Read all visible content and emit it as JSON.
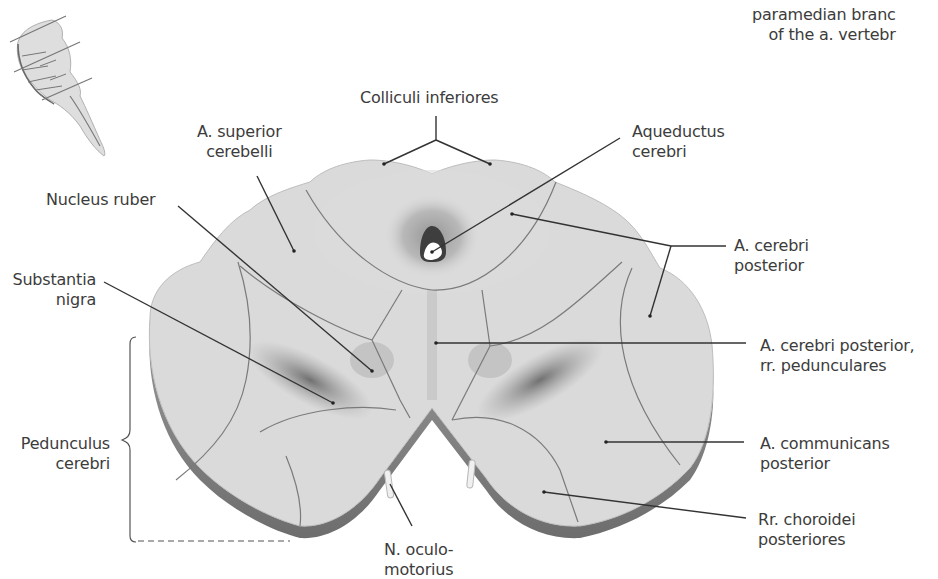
{
  "figure": {
    "title_fragment": {
      "line1": "paramedian branc",
      "line2": "of the a. vertebr"
    },
    "thumbnail": {
      "name": "brainstem-lateral-view-with-section-lines",
      "section_lines": 3
    },
    "colors": {
      "tissue": "#d9d9d9",
      "tissue_light": "#e3e3e3",
      "edge": "#8a8a8a",
      "outline": "#707070",
      "leader": "#333333",
      "text": "#3c3c3c",
      "dark_region": "#6e6e6e"
    }
  },
  "labels": {
    "colliculi": {
      "line1": "Colliculi inferiores"
    },
    "sup_cerebelli": {
      "line1": "A. superior",
      "line2": "cerebelli"
    },
    "aqueductus": {
      "line1": "Aqueductus",
      "line2": "cerebri"
    },
    "nucleus_ruber": {
      "line1": "Nucleus ruber"
    },
    "subst_nigra": {
      "line1": "Substantia",
      "line2": "nigra"
    },
    "cerebri_post": {
      "line1": "A. cerebri",
      "line2": "posterior"
    },
    "cerebri_post_ped": {
      "line1": "A. cerebri posterior,",
      "line2": "rr. pedunculares"
    },
    "pedunculus": {
      "line1": "Pedunculus",
      "line2": "cerebri"
    },
    "communicans": {
      "line1": "A. communicans",
      "line2": "posterior"
    },
    "choroidei": {
      "line1": "Rr. choroidei",
      "line2": "posteriores"
    },
    "oculomotorius": {
      "line1": "N. oculo-",
      "line2": "motorius"
    }
  }
}
